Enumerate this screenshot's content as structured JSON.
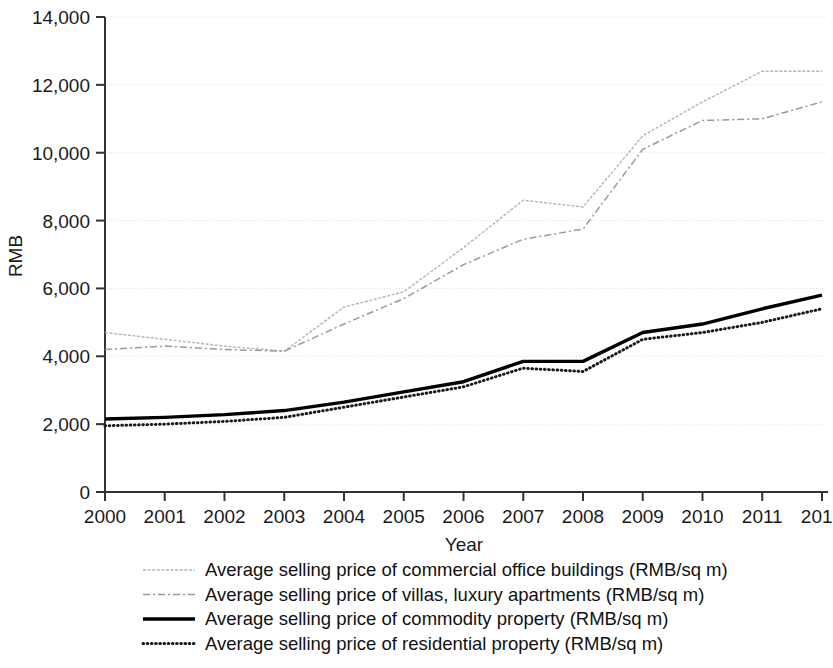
{
  "chart_data": {
    "type": "line",
    "title": "",
    "xlabel": "Year",
    "ylabel": "RMB",
    "categories": [
      "2000",
      "2001",
      "2002",
      "2003",
      "2004",
      "2005",
      "2006",
      "2007",
      "2008",
      "2009",
      "2010",
      "2011",
      "2012"
    ],
    "x": [
      2000,
      2001,
      2002,
      2003,
      2004,
      2005,
      2006,
      2007,
      2008,
      2009,
      2010,
      2011,
      2012
    ],
    "xlim": [
      2000,
      2012
    ],
    "ylim": [
      0,
      14000
    ],
    "yticks": [
      0,
      2000,
      4000,
      6000,
      8000,
      10000,
      12000,
      14000
    ],
    "ytick_labels": [
      "0",
      "2,000",
      "4,000",
      "6,000",
      "8,000",
      "10,000",
      "12,000",
      "14,000"
    ],
    "grid": true,
    "grid_axis": "y",
    "legend_position": "bottom",
    "series": [
      {
        "name": "Average selling price of commercial office buildings (RMB/sq m)",
        "short_name": "commercial-office-buildings",
        "style": "thin-solid-light",
        "color": "#b4b4b4",
        "values": [
          4700,
          4500,
          4300,
          4150,
          5450,
          5900,
          7200,
          8600,
          8400,
          10500,
          11500,
          12400,
          12400
        ]
      },
      {
        "name": "Average selling price of villas, luxury apartments (RMB/sq m)",
        "short_name": "villas-luxury-apartments",
        "style": "dash-dot",
        "color": "#9a9a9a",
        "values": [
          4200,
          4300,
          4200,
          4150,
          4950,
          5700,
          6700,
          7450,
          7750,
          10100,
          10950,
          11000,
          11500
        ]
      },
      {
        "name": "Average selling price of commodity property (RMB/sq m)",
        "short_name": "commodity-property",
        "style": "thick-solid",
        "color": "#000000",
        "values": [
          2150,
          2200,
          2280,
          2400,
          2650,
          2950,
          3250,
          3850,
          3850,
          4700,
          4950,
          5400,
          5800
        ]
      },
      {
        "name": "Average selling price of residential property (RMB/sq m)",
        "short_name": "residential-property",
        "style": "dotted",
        "color": "#1a1a1a",
        "values": [
          1950,
          2000,
          2080,
          2200,
          2500,
          2800,
          3100,
          3650,
          3550,
          4500,
          4700,
          5000,
          5400
        ]
      }
    ]
  },
  "axes": {
    "y_label": "RMB",
    "x_label": "Year"
  },
  "legend": {
    "items": [
      {
        "label": "Average selling price of commercial office buildings (RMB/sq m)",
        "swatch": "line-swatch-thin-light"
      },
      {
        "label": "Average selling price of villas, luxury apartments (RMB/sq m)",
        "swatch": "line-swatch-dash-dot"
      },
      {
        "label": "Average selling price of commodity property (RMB/sq m)",
        "swatch": "line-swatch-thick-solid"
      },
      {
        "label": "Average selling price of residential property (RMB/sq m)",
        "swatch": "line-swatch-dotted"
      }
    ]
  },
  "colors": {
    "axis": "#333333",
    "grid": "#dcdcdc",
    "background": "#ffffff"
  }
}
